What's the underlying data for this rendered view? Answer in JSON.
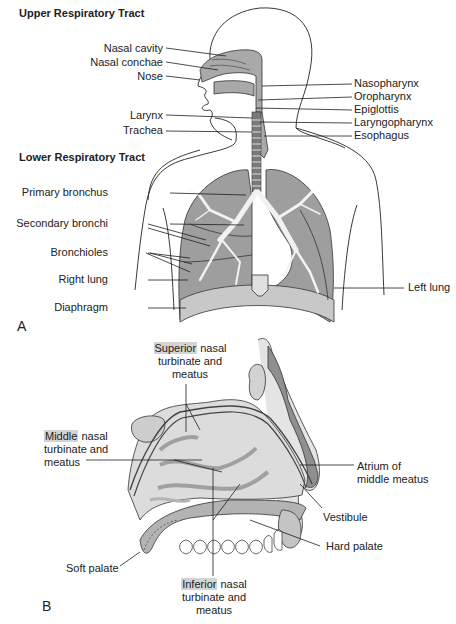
{
  "panel_a": {
    "letter": "A",
    "upper_heading": "Upper Respiratory Tract",
    "lower_heading": "Lower Respiratory Tract",
    "left_labels": [
      {
        "text": "Nasal cavity",
        "x": 96,
        "y": 41
      },
      {
        "text": "Nasal conchae",
        "x": 96,
        "y": 55
      },
      {
        "text": "Nose",
        "x": 96,
        "y": 69
      },
      {
        "text": "Larynx",
        "x": 96,
        "y": 108
      },
      {
        "text": "Trachea",
        "x": 96,
        "y": 124
      },
      {
        "text": "Primary bronchus",
        "x": 96,
        "y": 186
      },
      {
        "text": "Secondary bronchi",
        "x": 96,
        "y": 217
      },
      {
        "text": "Bronchioles",
        "x": 96,
        "y": 246
      },
      {
        "text": "Right lung",
        "x": 96,
        "y": 273
      },
      {
        "text": "Diaphragm",
        "x": 96,
        "y": 301
      }
    ],
    "right_labels": [
      {
        "text": "Nasopharynx",
        "x": 354,
        "y": 77
      },
      {
        "text": "Oropharynx",
        "x": 354,
        "y": 90
      },
      {
        "text": "Epiglottis",
        "x": 354,
        "y": 103
      },
      {
        "text": "Laryngopharynx",
        "x": 354,
        "y": 116
      },
      {
        "text": "Esophagus",
        "x": 354,
        "y": 129
      },
      {
        "text": "Left lung",
        "x": 408,
        "y": 281
      }
    ]
  },
  "panel_b": {
    "letter": "B",
    "labels": {
      "superior": {
        "highlight": "Superior",
        "rest": " nasal",
        "line2": "turbinate and",
        "line3": "meatus"
      },
      "middle": {
        "highlight": "Middle",
        "rest": " nasal",
        "line2": "turbinate and",
        "line3": "meatus"
      },
      "inferior": {
        "highlight": "Inferior",
        "rest": " nasal",
        "line2": "turbinate and",
        "line3": "meatus"
      },
      "atrium": {
        "line1": "Atrium of",
        "line2": "middle meatus"
      },
      "vestibule": "Vestibule",
      "hard_palate": "Hard palate",
      "soft_palate": "Soft palate"
    }
  },
  "colors": {
    "tissue_dark": "#8f8f8f",
    "tissue_mid": "#a9a9a9",
    "tissue_light": "#d9d9d9",
    "highlight": "#d4d4d4",
    "line": "#1e1e1e"
  }
}
